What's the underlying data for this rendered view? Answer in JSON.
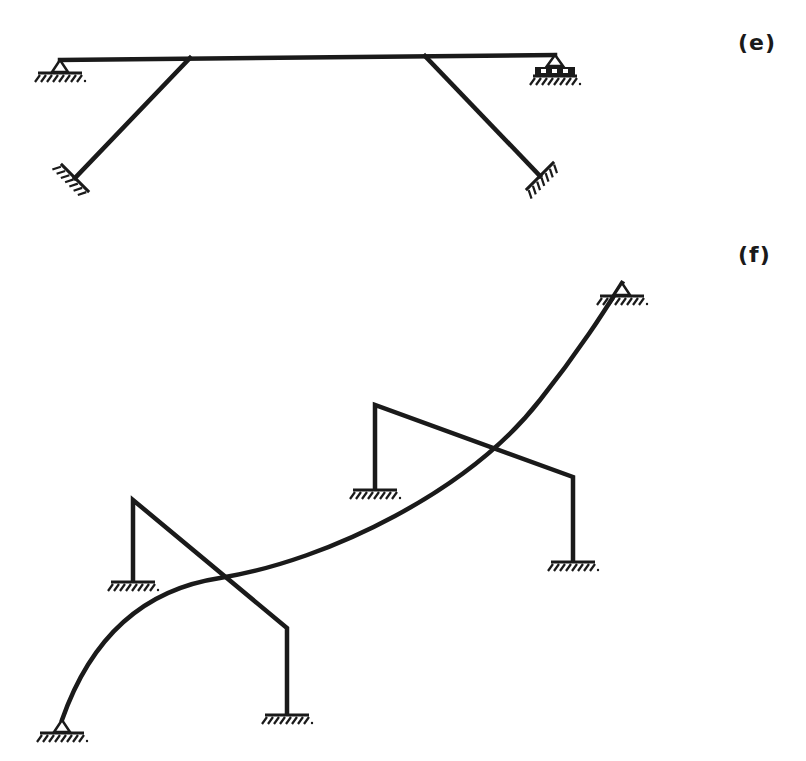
{
  "figure": {
    "panels": [
      {
        "id": "e",
        "label": "(e)",
        "description": "Horizontal beam on pin (left) and roller (right) supports, braced by two inclined struts to fixed supports",
        "elements": [
          {
            "type": "beam",
            "from": [
              60,
              60
            ],
            "to": [
              555,
              55
            ]
          },
          {
            "type": "pin-support",
            "at": [
              60,
              60
            ]
          },
          {
            "type": "roller-support",
            "at": [
              555,
              55
            ]
          },
          {
            "type": "strut",
            "from": [
              190,
              58
            ],
            "to": [
              75,
              178
            ],
            "end": "fixed-support"
          },
          {
            "type": "strut",
            "from": [
              425,
              56
            ],
            "to": [
              540,
              176
            ],
            "end": "fixed-support"
          }
        ]
      },
      {
        "id": "f",
        "label": "(f)",
        "description": "Curved arch member pinned at both ends crossing two bent portal frames with fixed column bases",
        "elements": [
          {
            "type": "curved-member",
            "from": [
              62,
              720
            ],
            "to": [
              622,
              283
            ],
            "end_supports": [
              "pin-support",
              "pin-support"
            ]
          },
          {
            "type": "bent-frame",
            "points": [
              [
                133,
                580
              ],
              [
                133,
                500
              ],
              [
                287,
                628
              ],
              [
                287,
                713
              ]
            ],
            "supports": [
              "fixed",
              "fixed"
            ]
          },
          {
            "type": "bent-frame",
            "points": [
              [
                375,
                488
              ],
              [
                375,
                405
              ],
              [
                573,
                477
              ],
              [
                573,
                560
              ]
            ],
            "supports": [
              "fixed",
              "fixed"
            ]
          }
        ]
      }
    ],
    "colors": {
      "ink": "#1a1a1a",
      "background": "#ffffff"
    }
  }
}
